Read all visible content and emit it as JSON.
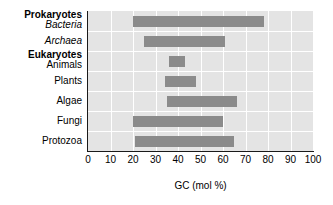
{
  "chart_data": {
    "type": "bar",
    "orientation": "horizontal",
    "subtype": "range-bar",
    "title": "",
    "xlabel": "GC (mol %)",
    "ylabel": "",
    "xlim": [
      0,
      100
    ],
    "ylim": null,
    "grid": true,
    "legend": null,
    "xticks": [
      "0",
      "10",
      "20",
      "30",
      "40",
      "50",
      "60",
      "70",
      "80",
      "90",
      "100"
    ],
    "xtick_values": [
      0,
      10,
      20,
      30,
      40,
      50,
      60,
      70,
      80,
      90,
      100
    ],
    "categories": [
      "Bacteria",
      "Archaea",
      "Animals",
      "Plants",
      "Algae",
      "Fungi",
      "Protozoa"
    ],
    "group_headers": [
      {
        "label": "Prokaryotes",
        "above_category": "Bacteria"
      },
      {
        "label": "Eukaryotes",
        "above_category": "Animals"
      }
    ],
    "rows": [
      {
        "label": "Bacteria",
        "style": "italic",
        "group": "Prokaryotes",
        "start": 20,
        "end": 78
      },
      {
        "label": "Archaea",
        "style": "italic",
        "group": "Prokaryotes",
        "start": 25,
        "end": 61
      },
      {
        "label": "Animals",
        "style": "plain",
        "group": "Eukaryotes",
        "start": 36,
        "end": 43
      },
      {
        "label": "Plants",
        "style": "plain",
        "group": "Eukaryotes",
        "start": 34,
        "end": 48
      },
      {
        "label": "Algae",
        "style": "plain",
        "group": "Eukaryotes",
        "start": 35,
        "end": 66
      },
      {
        "label": "Fungi",
        "style": "plain",
        "group": "Eukaryotes",
        "start": 20,
        "end": 60
      },
      {
        "label": "Protozoa",
        "style": "plain",
        "group": "Eukaryotes",
        "start": 21,
        "end": 65
      }
    ],
    "colors": {
      "bar": "#8b8b8b",
      "plot_background": "#e4e4e4",
      "gridline": "#ffffff",
      "axis": "#1a1a1a",
      "text": "#000000",
      "figure_background": "#ffffff"
    }
  }
}
